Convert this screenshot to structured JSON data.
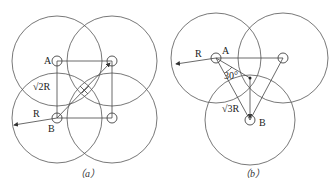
{
  "diagrams": [
    {
      "id": "a",
      "caption": "（a）",
      "labels": {
        "node_a": "A",
        "node_b": "B",
        "radius": "R",
        "diagonal": "√2R"
      },
      "circle_radius_px": 45,
      "nodes": [
        {
          "name": "A",
          "x": 57,
          "y": 61
        },
        {
          "name": "top-right",
          "x": 112,
          "y": 61
        },
        {
          "name": "B",
          "x": 57,
          "y": 118
        },
        {
          "name": "bottom-right",
          "x": 112,
          "y": 118
        }
      ]
    },
    {
      "id": "b",
      "caption": "（b）",
      "labels": {
        "node_a": "A",
        "node_b": "B",
        "radius": "R",
        "distance": "√3R",
        "angle": "30°"
      },
      "circle_radius_px": 45,
      "nodes": [
        {
          "name": "A",
          "x": 216,
          "y": 58
        },
        {
          "name": "right",
          "x": 283,
          "y": 58
        },
        {
          "name": "B",
          "x": 250,
          "y": 120
        }
      ]
    }
  ]
}
